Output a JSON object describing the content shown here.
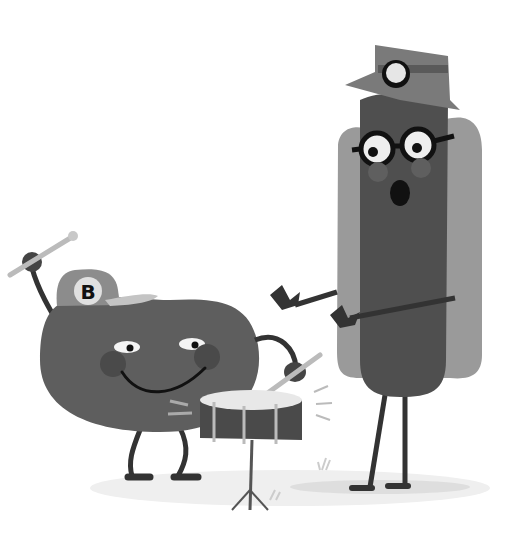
{
  "scene": {
    "description": "Grayscale cartoon illustration of a bean character playing a snare drum and a hot dog character with glasses and a miner's hat",
    "bean": {
      "cap_letter": "B"
    },
    "colors": {
      "background": "#ffffff",
      "bean_body": "#5e5e5e",
      "bean_cheeks": "#4a4a4a",
      "cap": "#8c8c8c",
      "cap_brim": "#bdbdbd",
      "bun": "#9a9a9a",
      "sausage": "#4f4f4f",
      "hat": "#7a7a7a",
      "lamp": "#e6e6e6",
      "outline": "#222222",
      "drum_body": "#4a4a4a",
      "drum_head": "#e8e8e8",
      "ground": "#eeeeee"
    }
  }
}
